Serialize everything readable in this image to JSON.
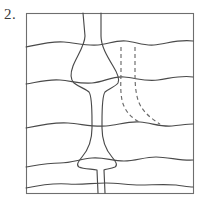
{
  "figure": {
    "label": "2.",
    "kind": "geologic-cross-section-sketch",
    "colors": {
      "background": "#ffffff",
      "frame_stroke": "#6e6e6e",
      "bed_stroke": "#4a4a4a",
      "dike_stroke": "#4a4a4a",
      "dashed_stroke": "#6a6a6a",
      "label_text": "#3a3a3a"
    }
  },
  "frame": {
    "name": "outer-box",
    "x": 26,
    "y": 13,
    "width": 167,
    "height": 180
  },
  "chart_data": {
    "type": "diagram",
    "title": "2.",
    "xlabel": "",
    "ylabel": "",
    "elements": {
      "bedding_planes": [
        {
          "name": "bed-contact-1",
          "approx_y": 45,
          "path": "M26,47 C40,44 52,41 64,42 C76,43 86,46 98,45 C108,44 116,40 126,41 C136,42 144,46 154,45 C166,44 178,39 193,41"
        },
        {
          "name": "bed-contact-2",
          "approx_y": 80,
          "path": "M26,84 C38,82 48,79 60,80 C72,81 80,84 92,83 C104,82 112,76 124,77 C136,78 146,82 158,80 C172,78 182,75 193,77"
        },
        {
          "name": "bed-contact-3",
          "approx_y": 126,
          "path": "M26,128 C40,125 54,122 68,123 C82,124 92,127 106,126 C118,125 128,121 140,122 C152,123 160,127 172,126 C182,125 188,124 193,124"
        },
        {
          "name": "bed-contact-4",
          "approx_y": 163,
          "path": "M26,167 C38,165 48,163 60,163 C72,163 80,159 92,158 C104,157 112,161 124,161 C136,161 144,157 156,157 C168,157 182,161 193,160"
        },
        {
          "name": "bed-contact-5",
          "approx_y": 186,
          "path": "M26,188 C40,185 54,183 68,184 C82,185 92,183 106,183 C118,183 128,185 140,185 C152,185 164,184 176,185 C184,186 189,187 193,187"
        }
      ],
      "dike": {
        "name": "intrusive-dike",
        "description": "Near-vertical tabular body running from top edge to bottom edge of the block, flaring outward between bedding planes",
        "left_margin_path": "M83,13 L85,36 C85,45 77,56 73,66 C70,74 70,79 74,83 C79,87 86,89 89,92 C92,96 92,110 92,122 L92,128 C92,140 88,150 82,157 C78,162 76,165 79,167 C83,169 92,169 97,170 L98,193",
        "right_margin_path": "M101,13 L101,36 C101,46 107,56 113,66 C118,74 120,79 118,83 C115,87 108,89 105,92 C102,96 102,110 102,122 L102,128 C102,140 106,150 112,157 C116,162 118,165 115,167 C111,169 105,169 104,170 L105,193"
      },
      "dashed_contacts": [
        {
          "name": "dashed-contact-left",
          "path": "M121,47 L121,70 C121,80 120,90 122,100 C124,110 131,118 141,123"
        },
        {
          "name": "dashed-contact-right",
          "path": "M135,47 L135,70 C135,80 135,90 138,100 C141,110 150,118 160,124"
        }
      ]
    },
    "counts": {
      "bedding_planes": 5,
      "dike_margins": 2,
      "dashed_contacts": 2
    }
  }
}
